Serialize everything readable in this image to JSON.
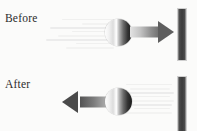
{
  "figure": {
    "type": "diagram",
    "background_color": "#fbfbfa"
  },
  "panels": [
    {
      "id": "before",
      "label": "Before",
      "description": "Ball moving right toward wall",
      "motion_direction": "right",
      "speed_lines_side": "left",
      "arrow": {
        "name": "velocity-arrow-right",
        "direction": "right",
        "color_start": "#e3e3e3",
        "color_end": "#5e5e5e"
      },
      "ball": {
        "name": "ball",
        "diameter_px": 27,
        "gradient_light_side": "left",
        "gradient_dark_side": "right"
      },
      "wall": {
        "name": "wall",
        "color": "#3c3c3c",
        "orientation": "vertical"
      }
    },
    {
      "id": "after",
      "label": "After",
      "description": "Ball rebounding left away from wall",
      "motion_direction": "left",
      "speed_lines_side": "right",
      "arrow": {
        "name": "velocity-arrow-left",
        "direction": "left",
        "color_start": "#4a4a4a",
        "color_end": "#d8d8d8"
      },
      "ball": {
        "name": "ball",
        "diameter_px": 27,
        "gradient_light_side": "left",
        "gradient_dark_side": "right"
      },
      "wall": {
        "name": "wall",
        "color": "#3c3c3c",
        "orientation": "vertical"
      }
    }
  ],
  "colors": {
    "wall": "#3c3c3c",
    "speed_line": "#ececec",
    "text": "#2b2b2b",
    "background": "#fbfbfa"
  }
}
